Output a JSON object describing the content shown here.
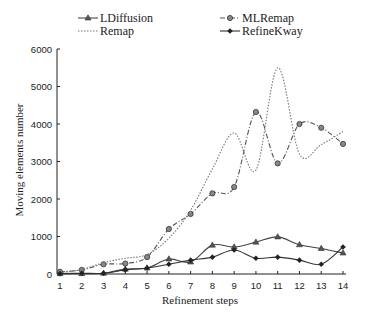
{
  "chart_data": {
    "type": "line",
    "title": "",
    "xlabel": "Refinement steps",
    "ylabel": "Moving elements number",
    "x": [
      1,
      2,
      3,
      4,
      5,
      6,
      7,
      8,
      9,
      10,
      11,
      12,
      13,
      14
    ],
    "ylim": [
      0,
      6000
    ],
    "yticks": [
      0,
      1000,
      2000,
      3000,
      4000,
      5000,
      6000
    ],
    "grid": false,
    "legend_position": "top",
    "series": [
      {
        "name": "LDiffusion",
        "style": "solid",
        "marker": "triangle",
        "values": [
          10,
          10,
          20,
          130,
          160,
          400,
          320,
          770,
          720,
          850,
          990,
          780,
          680,
          560
        ]
      },
      {
        "name": "MLRemap",
        "style": "dashdot",
        "marker": "circle",
        "values": [
          60,
          110,
          260,
          280,
          450,
          1200,
          1600,
          2150,
          2320,
          4320,
          2950,
          4000,
          3900,
          3470
        ]
      },
      {
        "name": "Remap",
        "style": "dotted",
        "marker": "none",
        "values": [
          40,
          120,
          300,
          420,
          520,
          950,
          1700,
          2800,
          3760,
          2770,
          5500,
          3200,
          3450,
          3800
        ]
      },
      {
        "name": "RefineKway",
        "style": "solid",
        "marker": "diamond",
        "values": [
          10,
          20,
          20,
          110,
          160,
          260,
          370,
          450,
          640,
          420,
          450,
          370,
          260,
          720
        ]
      }
    ]
  }
}
